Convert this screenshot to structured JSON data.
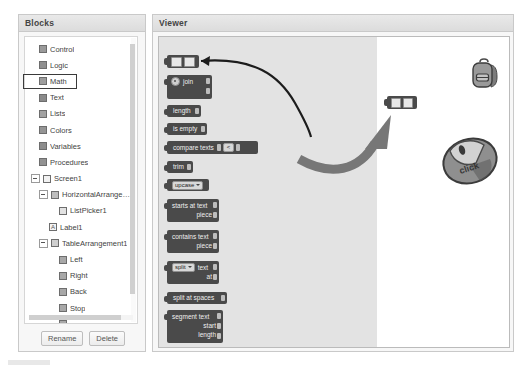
{
  "app": {
    "name": "MIT App Inventor Blocks Editor"
  },
  "blocks_panel": {
    "title": "Blocks",
    "builtin": [
      {
        "label": "Control",
        "icon": "control-category-icon"
      },
      {
        "label": "Logic",
        "icon": "logic-category-icon"
      },
      {
        "label": "Math",
        "icon": "math-category-icon"
      },
      {
        "label": "Text",
        "icon": "text-category-icon",
        "selected": true
      },
      {
        "label": "Lists",
        "icon": "lists-category-icon"
      },
      {
        "label": "Colors",
        "icon": "colors-category-icon"
      },
      {
        "label": "Variables",
        "icon": "variables-category-icon"
      },
      {
        "label": "Procedures",
        "icon": "procedures-category-icon"
      }
    ],
    "tree": [
      {
        "label": "Screen1",
        "indent": 0,
        "expander": true,
        "icon": "screen-icon"
      },
      {
        "label": "HorizontalArrangement1",
        "indent": 1,
        "expander": true,
        "icon": "horizontal-arrangement-icon"
      },
      {
        "label": "ListPicker1",
        "indent": 2,
        "expander": false,
        "icon": "listpicker-icon"
      },
      {
        "label": "Label1",
        "indent": 1,
        "expander": false,
        "icon": "label-icon"
      },
      {
        "label": "TableArrangement1",
        "indent": 1,
        "expander": true,
        "icon": "table-arrangement-icon"
      },
      {
        "label": "Left",
        "indent": 2,
        "expander": false,
        "icon": "button-icon"
      },
      {
        "label": "Right",
        "indent": 2,
        "expander": false,
        "icon": "button-icon"
      },
      {
        "label": "Back",
        "indent": 2,
        "expander": false,
        "icon": "button-icon"
      },
      {
        "label": "Stop",
        "indent": 2,
        "expander": false,
        "icon": "button-icon"
      }
    ],
    "buttons": {
      "rename": "Rename",
      "delete": "Delete"
    }
  },
  "viewer": {
    "title": "Viewer",
    "backpack_icon": "backpack-icon",
    "flyout_blocks": [
      {
        "id": "text-string",
        "kind": "string",
        "label": ""
      },
      {
        "id": "join",
        "kind": "mutator-rows",
        "label": "join",
        "rows": 2
      },
      {
        "id": "length",
        "kind": "single",
        "label": "length"
      },
      {
        "id": "is-empty",
        "kind": "single",
        "label": "is empty"
      },
      {
        "id": "compare-texts",
        "kind": "compare",
        "label": "compare texts",
        "operator": "<"
      },
      {
        "id": "trim",
        "kind": "single",
        "label": "trim"
      },
      {
        "id": "upcase",
        "kind": "dropdown-single",
        "label": "upcase"
      },
      {
        "id": "starts-at",
        "kind": "two-row",
        "label1": "starts at  text",
        "label2": "piece"
      },
      {
        "id": "contains",
        "kind": "two-row",
        "label1": "contains  text",
        "label2": "piece"
      },
      {
        "id": "split",
        "kind": "dropdown-two-row",
        "dropdown": "split",
        "label1": "text",
        "label2": "at"
      },
      {
        "id": "split-at-spaces",
        "kind": "single",
        "label": "split at spaces"
      },
      {
        "id": "segment",
        "kind": "three-row",
        "label1": "segment  text",
        "label2": "start",
        "label3": "length"
      }
    ],
    "canvas_blocks": [
      {
        "id": "dropped-text-string",
        "kind": "string",
        "label": ""
      }
    ],
    "annotations": {
      "mouse_image": "computer-mouse-illustration",
      "drag_arrow": "curved-drag-arrow",
      "source_arrow": "curved-source-arrow"
    }
  },
  "colors": {
    "block_fill": "#4a4a4a",
    "flyout_bg": "#e3e3e3",
    "panel_bg": "#f7f7f7",
    "selection_border": "#3a3a3a"
  }
}
